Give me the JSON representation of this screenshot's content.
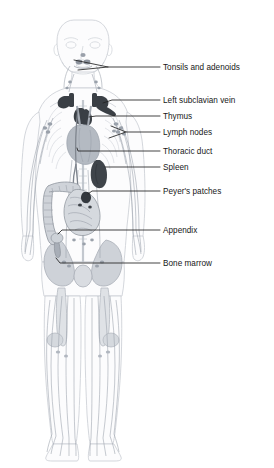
{
  "diagram": {
    "background_color": "#ffffff",
    "text_color": "#171717",
    "leader_line_color": "#222222",
    "body_outline_color": "#c8ccd2",
    "vessel_color": "#9aa1ab",
    "organ_fill_dark": "#3a3f45",
    "organ_fill_mid": "#9096a0",
    "organ_fill_light": "#d7dadf"
  },
  "labels": [
    {
      "id": "tonsils-and-adenoids",
      "text": "Tonsils and adenoids",
      "x": 163,
      "y": 66
    },
    {
      "id": "left-subclavian-vein",
      "text": "Left subclavian vein",
      "x": 163,
      "y": 99
    },
    {
      "id": "thymus",
      "text": "Thymus",
      "x": 163,
      "y": 115
    },
    {
      "id": "lymph-nodes",
      "text": "Lymph nodes",
      "x": 163,
      "y": 131
    },
    {
      "id": "thoracic-duct",
      "text": "Thoracic duct",
      "x": 163,
      "y": 150
    },
    {
      "id": "spleen",
      "text": "Spleen",
      "x": 163,
      "y": 166
    },
    {
      "id": "peyers-patches",
      "text": "Peyer's patches",
      "x": 163,
      "y": 190
    },
    {
      "id": "appendix",
      "text": "Appendix",
      "x": 163,
      "y": 229
    },
    {
      "id": "bone-marrow",
      "text": "Bone marrow",
      "x": 163,
      "y": 262
    }
  ],
  "structures": [
    {
      "id": "tonsils-and-adenoids",
      "region": "head-neck",
      "fill": "#8d939d"
    },
    {
      "id": "left-subclavian-vein",
      "region": "upper-thorax",
      "fill": "#3a3f45"
    },
    {
      "id": "thymus",
      "region": "mediastinum",
      "fill": "#3a3f45"
    },
    {
      "id": "lymph-nodes",
      "region": "axilla",
      "fill": "#9aa1ab"
    },
    {
      "id": "thoracic-duct",
      "region": "posterior-thorax",
      "fill": "#8d939d"
    },
    {
      "id": "spleen",
      "region": "left-upper-abdomen",
      "fill": "#3f444a"
    },
    {
      "id": "peyers-patches",
      "region": "small-intestine",
      "fill": "#3a3f45"
    },
    {
      "id": "appendix",
      "region": "right-lower-abdomen",
      "fill": "#9aa1ab"
    },
    {
      "id": "bone-marrow",
      "region": "pelvis-femur",
      "fill": "#b9bec6"
    }
  ]
}
